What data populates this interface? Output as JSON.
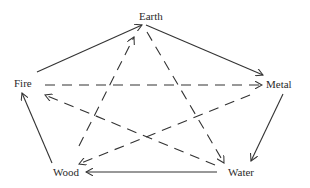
{
  "diagram": {
    "type": "five-elements-cycle",
    "colors": {
      "stroke": "#333333",
      "text": "#2a2a2a",
      "background": "#ffffff"
    },
    "nodes": [
      {
        "id": "earth",
        "label": "Earth",
        "x": 139,
        "y": 11
      },
      {
        "id": "fire",
        "label": "Fire",
        "x": 14,
        "y": 78
      },
      {
        "id": "metal",
        "label": "Metal",
        "x": 266,
        "y": 79
      },
      {
        "id": "wood",
        "label": "Wood",
        "x": 53,
        "y": 167
      },
      {
        "id": "water",
        "label": "Water",
        "x": 228,
        "y": 167
      }
    ],
    "edges": [
      {
        "from": "fire",
        "to": "earth",
        "style": "solid",
        "x1": 37,
        "y1": 72,
        "x2": 142,
        "y2": 25
      },
      {
        "from": "earth",
        "to": "metal",
        "style": "solid",
        "x1": 146,
        "y1": 25,
        "x2": 263,
        "y2": 75
      },
      {
        "from": "metal",
        "to": "water",
        "style": "solid",
        "x1": 283,
        "y1": 94,
        "x2": 251,
        "y2": 161
      },
      {
        "from": "water",
        "to": "wood",
        "style": "solid",
        "x1": 217,
        "y1": 172,
        "x2": 86,
        "y2": 172
      },
      {
        "from": "wood",
        "to": "fire",
        "style": "solid",
        "x1": 52,
        "y1": 163,
        "x2": 22,
        "y2": 93
      },
      {
        "from": "fire",
        "to": "metal",
        "style": "dashed",
        "x1": 45,
        "y1": 85,
        "x2": 262,
        "y2": 85
      },
      {
        "from": "earth",
        "to": "water",
        "style": "dashed",
        "x1": 147,
        "y1": 32,
        "x2": 224,
        "y2": 163
      },
      {
        "from": "water",
        "to": "fire",
        "style": "dashed",
        "x1": 215,
        "y1": 165,
        "x2": 45,
        "y2": 95
      },
      {
        "from": "metal",
        "to": "wood",
        "style": "dashed",
        "x1": 250,
        "y1": 95,
        "x2": 79,
        "y2": 164
      },
      {
        "from": "wood",
        "to": "earth",
        "style": "dashed",
        "x1": 79,
        "y1": 146,
        "x2": 134,
        "y2": 37
      }
    ]
  }
}
